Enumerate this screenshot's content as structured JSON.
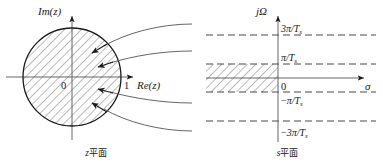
{
  "figure": {
    "title": "",
    "panels": [
      {
        "id": "z-plane",
        "caption_italic": "z",
        "caption_han": "平面",
        "axes": {
          "vertical_label": "Im(z)",
          "horizontal_label": "Re(z)",
          "origin_label": "0",
          "unit_label": "1"
        },
        "region": {
          "name": "unit-disk",
          "hatched": true,
          "description": "unit circle interior"
        },
        "arrows": [
          {
            "name": "inward-arrow-1"
          },
          {
            "name": "inward-arrow-2"
          },
          {
            "name": "inward-arrow-3"
          },
          {
            "name": "inward-arrow-4"
          }
        ],
        "curves": 4
      },
      {
        "id": "s-plane",
        "caption_italic": "s",
        "caption_han": "平面",
        "axes": {
          "vertical_label": "jΩ",
          "horizontal_label": "σ",
          "origin_label": "0"
        },
        "tick_labels": [
          {
            "name": "tick-3pi-over-Ts",
            "text": "3π/T",
            "sub": "s",
            "sign": ""
          },
          {
            "name": "tick-pi-over-Ts",
            "text": "π/T",
            "sub": "s",
            "sign": ""
          },
          {
            "name": "tick-neg-pi-over-Ts",
            "text": "π/T",
            "sub": "s",
            "sign": "−"
          },
          {
            "name": "tick-neg-3pi-over-Ts",
            "text": "3π/T",
            "sub": "s",
            "sign": "−"
          }
        ],
        "region": {
          "name": "primary-strip",
          "hatched": true,
          "description": "left half strip between -pi/Ts and pi/Ts"
        },
        "dashed_lines": 4
      }
    ]
  },
  "colors": {
    "stroke": "#1a1a1a",
    "hatch": "#555555",
    "axis": "#555555",
    "dash": "#333333",
    "background": "#ffffff"
  }
}
